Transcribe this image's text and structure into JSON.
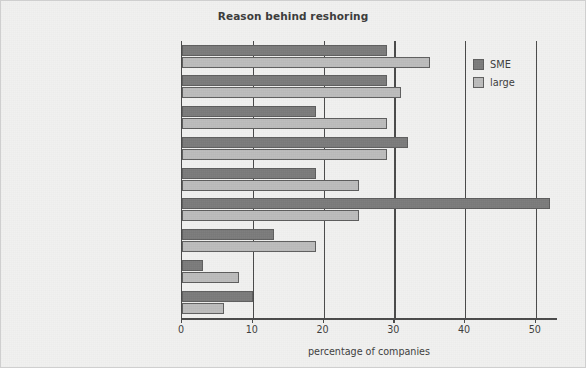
{
  "chart_data": {
    "type": "bar",
    "orientation": "horizontal",
    "title": "Reason behind reshoring",
    "xlabel": "percentage of companies",
    "ylabel": "",
    "xlim": [
      0,
      53
    ],
    "xticks": [
      0,
      10,
      20,
      30,
      40,
      50
    ],
    "grid": "vertical",
    "legend_position": "upper right",
    "categories": [
      "more certainty on delivery times",
      "minimize logistics costs",
      "reduce inventory costs",
      "reduce product delivery time",
      "minimize supply chain risks",
      "improve quality of inputs",
      "wage inflation overseas",
      "improve environmental credentials",
      "improve customer collaboration"
    ],
    "series": [
      {
        "name": "SME",
        "color": "#7b7b7b",
        "values": [
          29,
          29,
          19,
          32,
          19,
          52,
          13,
          3,
          10
        ]
      },
      {
        "name": "large",
        "color": "#bcbcbc",
        "values": [
          35,
          31,
          29,
          29,
          25,
          25,
          19,
          8,
          6
        ]
      }
    ]
  },
  "figure": {
    "background_color": "#f1f1f0",
    "axis_color": "#4a4a4a",
    "text_color": "#3d3d3d"
  }
}
